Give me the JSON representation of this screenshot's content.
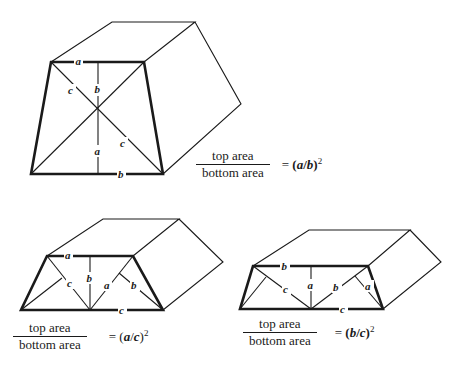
{
  "figures": [
    {
      "id": "top",
      "description": "Prism with trapezoid cross-section, diagonals crossing",
      "labels": {
        "top_edge": "a",
        "upper_vertical": "b",
        "upper_diagonal": "c",
        "lower_diagonal": "c",
        "lower_vertical": "a",
        "bottom_edge": "b"
      },
      "formula": {
        "numerator": "top area",
        "denominator": "bottom area",
        "equals": "= ",
        "ratio_open": "(",
        "ratio_num": "a",
        "slash": "/",
        "ratio_den": "b",
        "ratio_close": ")",
        "exponent": "2"
      }
    },
    {
      "id": "bottom-left",
      "description": "Prism with trapezoid cross-section, center point on bottom edge",
      "labels": {
        "top_edge": "a",
        "vertical": "b",
        "left_perp": "c",
        "right_diag": "a",
        "right_perp": "b",
        "bottom_edge": "c"
      },
      "formula": {
        "numerator": "top area",
        "denominator": "bottom area",
        "equals": "= ",
        "ratio_open": "(",
        "ratio_num": "a",
        "slash": "/",
        "ratio_den": "c",
        "ratio_close": ")",
        "exponent": "2"
      }
    },
    {
      "id": "bottom-right",
      "description": "Flatter prism with trapezoid cross-section",
      "labels": {
        "top_edge": "b",
        "left_diag": "c",
        "vertical": "a",
        "right_diag": "b",
        "right_perp": "a",
        "bottom_edge": "c"
      },
      "formula": {
        "numerator": "top area",
        "denominator": "bottom area",
        "equals": "= ",
        "ratio_open": "(",
        "ratio_num": "b",
        "slash": "/",
        "ratio_den": "c",
        "ratio_close": ")",
        "exponent": "2"
      }
    }
  ]
}
